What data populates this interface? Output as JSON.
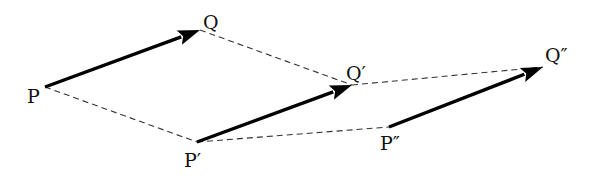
{
  "diagram": {
    "type": "vector-translation",
    "points": {
      "P": {
        "label": "P",
        "x": 45,
        "y": 87,
        "lx": 27,
        "ly": 103
      },
      "Q": {
        "label": "Q",
        "x": 200,
        "y": 30,
        "lx": 203,
        "ly": 29
      },
      "P1": {
        "label": "P′",
        "x": 197,
        "y": 142,
        "lx": 184,
        "ly": 167
      },
      "Q1": {
        "label": "Q′",
        "x": 352,
        "y": 85,
        "lx": 346,
        "ly": 80
      },
      "P2": {
        "label": "P″",
        "x": 389,
        "y": 127,
        "lx": 380,
        "ly": 150
      },
      "Q2": {
        "label": "Q″",
        "x": 543,
        "y": 67,
        "lx": 545,
        "ly": 62
      }
    },
    "vectors": [
      {
        "name": "PQ",
        "from": "P",
        "to": "Q"
      },
      {
        "name": "P1Q1",
        "from": "P1",
        "to": "Q1"
      },
      {
        "name": "P2Q2",
        "from": "P2",
        "to": "Q2"
      }
    ],
    "dashed_lines": [
      {
        "name": "P-P1",
        "from": "P",
        "to": "P1"
      },
      {
        "name": "Q-Q1",
        "from": "Q",
        "to": "Q1"
      },
      {
        "name": "P1-P2",
        "from": "P1",
        "to": "P2"
      },
      {
        "name": "Q1-Q2",
        "from": "Q1",
        "to": "Q2"
      }
    ],
    "colors": {
      "vector": "#000000",
      "dashed": "#333333",
      "background": "#ffffff"
    }
  }
}
